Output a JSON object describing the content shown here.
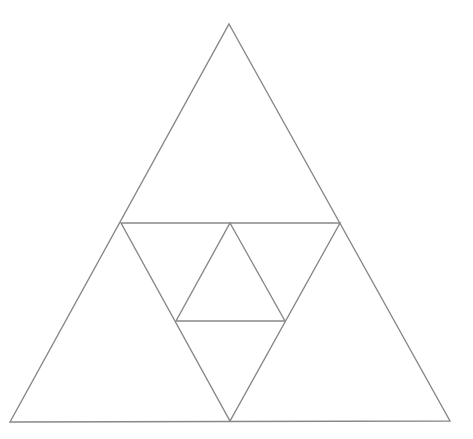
{
  "diagram": {
    "stroke_color": "#888888",
    "background": "#ffffff",
    "stroke_width": 1.4,
    "polylines": [
      {
        "name": "outer-triangle",
        "points": [
          [
            229,
            24
          ],
          [
            450,
            421
          ],
          [
            10,
            422
          ]
        ],
        "closed": true
      },
      {
        "name": "midpoint-triangle",
        "points": [
          [
            121,
            223
          ],
          [
            340,
            223
          ],
          [
            230,
            421
          ]
        ],
        "closed": true
      },
      {
        "name": "inner-triangle",
        "points": [
          [
            230,
            223
          ],
          [
            285,
            321
          ],
          [
            176,
            321
          ]
        ],
        "closed": true
      }
    ]
  },
  "caption": {
    "text": ""
  }
}
